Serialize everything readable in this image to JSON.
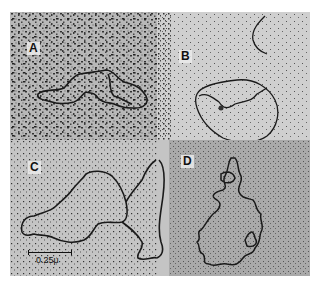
{
  "figure": {
    "panels": [
      {
        "id": "A",
        "label": "A",
        "background": "#b8b8b8",
        "grain": "coarse"
      },
      {
        "id": "B",
        "label": "B",
        "background": "#cfcfcf",
        "grain": "fine"
      },
      {
        "id": "C",
        "label": "C",
        "background": "#c4c4c4",
        "grain": "medium"
      },
      {
        "id": "D",
        "label": "D",
        "background": "#a9a9a9",
        "grain": "fine"
      }
    ],
    "scale_bar": {
      "label": "0.25μ"
    },
    "colors": {
      "strand": "#1a1a1a",
      "page": "#ffffff"
    }
  }
}
